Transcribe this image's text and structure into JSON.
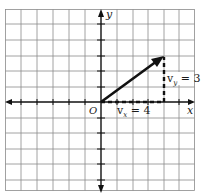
{
  "diagram": {
    "type": "vector-components-on-grid",
    "axes": {
      "x_label": "x",
      "y_label": "y",
      "origin_label": "O"
    },
    "grid": {
      "x_min": -6,
      "x_max": 6,
      "y_min": -6,
      "y_max": 6,
      "cell_px": 15.7,
      "line_color": "#8a8a8a",
      "border_color": "#8a8a8a"
    },
    "vector": {
      "from": [
        0,
        0
      ],
      "to": [
        4,
        3
      ],
      "color": "#111111"
    },
    "components": [
      {
        "name": "vx",
        "label_main": "v",
        "label_sub": "x",
        "label_rest": " = 4",
        "value": 4,
        "style": "dashed"
      },
      {
        "name": "vy",
        "label_main": "v",
        "label_sub": "y",
        "label_rest": " = 3",
        "value": 3,
        "style": "dashed"
      }
    ]
  }
}
